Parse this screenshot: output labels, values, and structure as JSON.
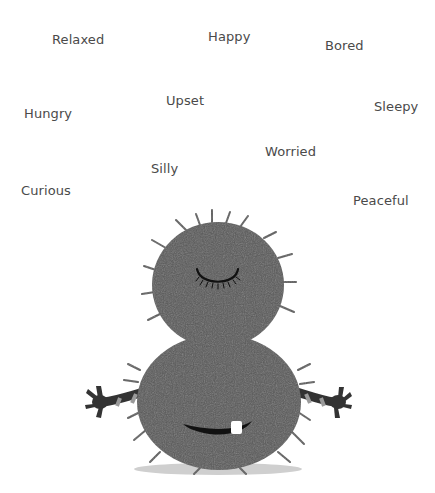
{
  "words": [
    {
      "id": "relaxed",
      "label": "Relaxed"
    },
    {
      "id": "happy",
      "label": "Happy"
    },
    {
      "id": "bored",
      "label": "Bored"
    },
    {
      "id": "hungry",
      "label": "Hungry"
    },
    {
      "id": "upset",
      "label": "Upset"
    },
    {
      "id": "sleepy",
      "label": "Sleepy"
    },
    {
      "id": "worried",
      "label": "Worried"
    },
    {
      "id": "silly",
      "label": "Silly"
    },
    {
      "id": "curious",
      "label": "Curious"
    },
    {
      "id": "peaceful",
      "label": "Peaceful"
    }
  ],
  "colors": {
    "text": "#4a4a4a",
    "fur": "#585858",
    "fur_dark": "#4a4a4a",
    "feature": "#111111",
    "stripe_light": "#9a9a9a",
    "shadow": "#cfcfcf",
    "tooth": "#ffffff"
  },
  "monster": {
    "name": "fuzzy-monster",
    "expression": "peaceful",
    "eyes": "closed"
  }
}
